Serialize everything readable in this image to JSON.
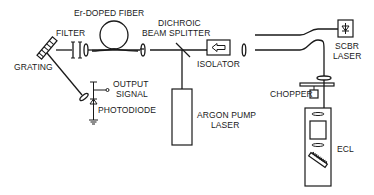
{
  "diagram": {
    "type": "optical setup schematic",
    "labels": {
      "er_fiber": "Er-DOPED FIBER",
      "filter": "FILTER",
      "dichroic_1": "DICHROIC",
      "dichroic_2": "BEAM SPLITTER",
      "isolator": "ISOLATOR",
      "grating": "GRATING",
      "output_1": "OUTPUT",
      "output_2": "SIGNAL",
      "photodiode": "PHOTODIODE",
      "argon_1": "ARGON PUMP",
      "argon_2": "LASER",
      "scbr_1": "SCBR",
      "scbr_2": "LASER",
      "chopper": "CHOPPER",
      "ecl": "ECL"
    },
    "components": [
      "grating",
      "filter",
      "lens",
      "er-doped-fiber-coil",
      "lens",
      "dichroic-beam-splitter",
      "isolator",
      "lens",
      "fiber-coupler",
      "scbr-laser",
      "chopper",
      "ecl",
      "argon-pump-laser",
      "photodiode"
    ],
    "colors": {
      "ink": "#1a1a1a",
      "background": "#ffffff"
    }
  }
}
